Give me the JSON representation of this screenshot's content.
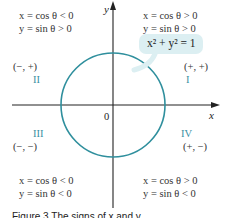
{
  "diagram": {
    "axes": {
      "x_label": "x",
      "y_label": "y",
      "origin_label": "0"
    },
    "circle": {
      "equation": "x² + y² = 1",
      "color": "#2f8f9d",
      "callout_bg": "#dceff2"
    },
    "quadrants": [
      {
        "numeral": "I",
        "signs": "(+, +)",
        "cos_line": "x = cos θ > 0",
        "sin_line": "y = sin θ > 0"
      },
      {
        "numeral": "II",
        "signs": "(−, +)",
        "cos_line": "x = cos θ < 0",
        "sin_line": "y = sin θ > 0"
      },
      {
        "numeral": "III",
        "signs": "(−, −)",
        "cos_line": "x = cos θ < 0",
        "sin_line": "y = sin θ < 0"
      },
      {
        "numeral": "IV",
        "signs": "(+, −)",
        "cos_line": "x = cos θ > 0",
        "sin_line": "y = sin θ < 0"
      }
    ],
    "caption": "Figure 3  The signs of x and y"
  }
}
